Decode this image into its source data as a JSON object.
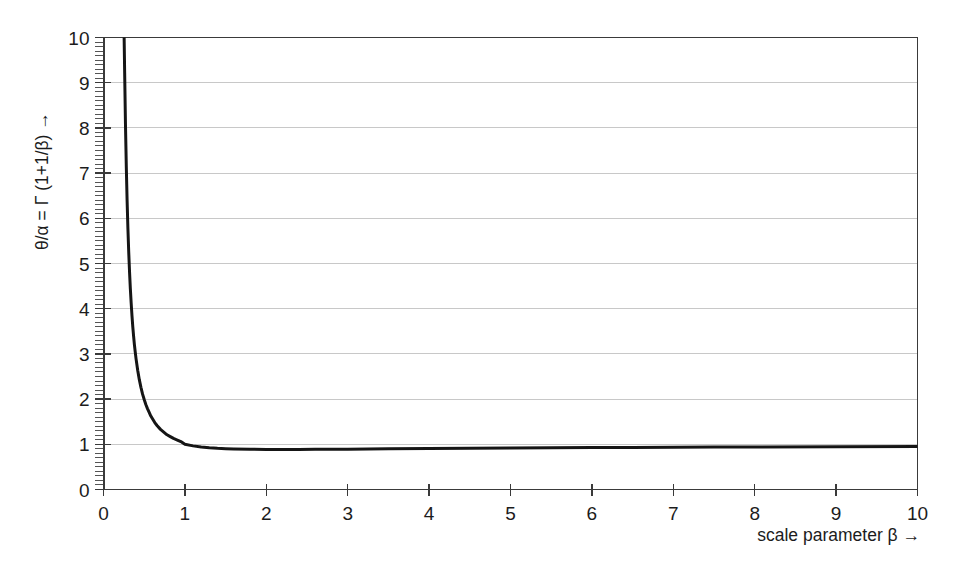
{
  "chart_data": {
    "type": "line",
    "title": "",
    "xlabel": "scale parameter β →",
    "ylabel": "θ/α = Γ (1+1/β) →",
    "xlim": [
      0,
      10
    ],
    "ylim": [
      0,
      10
    ],
    "xticks": [
      0,
      1,
      2,
      3,
      4,
      5,
      6,
      7,
      8,
      9,
      10
    ],
    "yticks": [
      0,
      1,
      2,
      3,
      4,
      5,
      6,
      7,
      8,
      9,
      10
    ],
    "xtick_labels": [
      "0",
      "1",
      "2",
      "3",
      "4",
      "5",
      "6",
      "7",
      "8",
      "9",
      "10"
    ],
    "ytick_labels": [
      "0",
      "1",
      "2",
      "3",
      "4",
      "5",
      "6",
      "7",
      "8",
      "9",
      "10"
    ],
    "grid": "horizontal",
    "grid_color": "#c8c8c8",
    "legend": "none",
    "minor_ticks": {
      "x": false,
      "y": true,
      "y_per_major": 10
    },
    "series": [
      {
        "name": "θ/α = Γ (1+1/β)",
        "color": "#151515",
        "line_width": 3,
        "x": [
          0.2535,
          0.26,
          0.27,
          0.28,
          0.29,
          0.3,
          0.31,
          0.32,
          0.33,
          0.34,
          0.35,
          0.36,
          0.37,
          0.38,
          0.39,
          0.4,
          0.42,
          0.44,
          0.46,
          0.48,
          0.5,
          0.52,
          0.54,
          0.56,
          0.58,
          0.6,
          0.63,
          0.66,
          0.7,
          0.74,
          0.78,
          0.82,
          0.86,
          0.9,
          0.95,
          1.0,
          1.1,
          1.2,
          1.3,
          1.4,
          1.5,
          1.6,
          1.8,
          2.0,
          2.2,
          2.4,
          2.6,
          2.8,
          3.0,
          3.5,
          4.0,
          4.5,
          5.0,
          5.5,
          6.0,
          6.5,
          7.0,
          7.5,
          8.0,
          9.0,
          10.0
        ],
        "y": [
          10.0,
          9.22,
          8.07,
          7.15,
          6.39,
          5.77,
          5.25,
          4.81,
          4.44,
          4.12,
          3.84,
          3.6,
          3.39,
          3.2,
          3.04,
          2.89,
          2.64,
          2.43,
          2.26,
          2.11,
          1.99,
          1.88,
          1.79,
          1.71,
          1.63,
          1.57,
          1.48,
          1.41,
          1.33,
          1.27,
          1.21,
          1.17,
          1.13,
          1.1,
          1.06,
          1.0,
          0.965,
          0.941,
          0.924,
          0.911,
          0.903,
          0.897,
          0.889,
          0.886,
          0.885,
          0.886,
          0.888,
          0.89,
          0.893,
          0.9,
          0.906,
          0.912,
          0.918,
          0.923,
          0.928,
          0.931,
          0.935,
          0.938,
          0.941,
          0.947,
          0.951
        ]
      }
    ],
    "annotations": []
  },
  "axes": {
    "y_title": "θ/α = Γ (1+1/β) →",
    "x_title": "scale parameter β →"
  }
}
